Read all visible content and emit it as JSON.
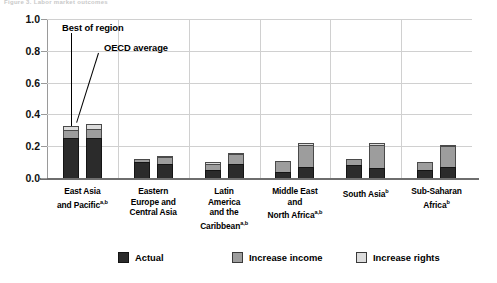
{
  "header": {
    "clipped_text": "Figure 3. Labor market outcomes"
  },
  "chart_data": {
    "type": "bar",
    "stacked": true,
    "title": "",
    "xlabel": "",
    "ylabel": "",
    "ylim": [
      0.0,
      1.0
    ],
    "yticks": [
      "0.0",
      "0.2",
      "0.4",
      "0.6",
      "0.8",
      "1.0"
    ],
    "ytick_values": [
      0.0,
      0.2,
      0.4,
      0.6,
      0.8,
      1.0
    ],
    "grid": true,
    "legend_position": "bottom",
    "categories": [
      "East Asia and Pacific",
      "Eastern Europe and Central Asia",
      "Latin America and the Caribbean",
      "Middle East and North Africa",
      "South Asia",
      "Sub-Saharan Africa"
    ],
    "category_footnotes": [
      "a,b",
      "",
      "a,b",
      "a,b",
      "b",
      "b"
    ],
    "category_labels": [
      [
        "East Asia",
        "and Pacific"
      ],
      [
        "Eastern",
        "Europe and",
        "Central Asia"
      ],
      [
        "Latin",
        "America",
        "and the",
        "Caribbean"
      ],
      [
        "Middle East",
        "and",
        "North Africa"
      ],
      [
        "South Asia"
      ],
      [
        "Sub-Saharan",
        "Africa"
      ]
    ],
    "bar_kinds": [
      "Best of region",
      "OECD average"
    ],
    "series": [
      {
        "name": "Actual",
        "color": "#2b2b2b",
        "values_best_of_region": [
          0.25,
          0.1,
          0.05,
          0.04,
          0.08,
          0.05
        ],
        "values_oecd_average": [
          0.25,
          0.09,
          0.09,
          0.07,
          0.06,
          0.07
        ]
      },
      {
        "name": "Increase income",
        "color": "#9d9d9d",
        "values_best_of_region": [
          0.05,
          0.02,
          0.04,
          0.07,
          0.04,
          0.05
        ],
        "values_oecd_average": [
          0.06,
          0.04,
          0.06,
          0.14,
          0.15,
          0.13
        ]
      },
      {
        "name": "Increase rights",
        "color": "#dcdcdc",
        "values_best_of_region": [
          0.03,
          0.0,
          0.01,
          0.0,
          0.0,
          0.0
        ],
        "values_oecd_average": [
          0.03,
          0.01,
          0.01,
          0.01,
          0.01,
          0.01
        ]
      }
    ],
    "annotations": [
      {
        "text": "Best of region",
        "target_bar": "East Asia and Pacific / bar 1"
      },
      {
        "text": "OECD average",
        "target_bar": "East Asia and Pacific / bar 2"
      }
    ]
  },
  "legend": {
    "items": [
      {
        "label": "Actual",
        "key": "actual"
      },
      {
        "label": "Increase income",
        "key": "income"
      },
      {
        "label": "Increase rights",
        "key": "rights"
      }
    ]
  }
}
